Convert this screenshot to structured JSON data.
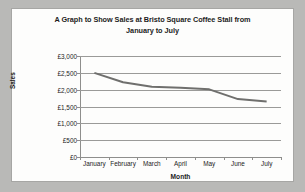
{
  "chart_data": {
    "type": "line",
    "title": "A Graph to Show Sales at Bristo Square Coffee Stall from January to July",
    "title_line1": "A Graph to Show Sales at Bristo Square Coffee Stall from",
    "title_line2": "January to July",
    "xlabel": "Month",
    "ylabel": "Sales",
    "categories": [
      "January",
      "February",
      "March",
      "April",
      "May",
      "June",
      "July"
    ],
    "values": [
      2500,
      2220,
      2090,
      2060,
      2010,
      1720,
      1650
    ],
    "ytick_labels": [
      "£3,000",
      "£2,500",
      "£2,000",
      "£1,500",
      "£1,000",
      "£500",
      "£0"
    ],
    "ytick_values": [
      3000,
      2500,
      2000,
      1500,
      1000,
      500,
      0
    ],
    "ylim": [
      0,
      3000
    ],
    "grid": true,
    "legend": "none",
    "series_color": "#6f6f6d",
    "grid_color": "#9a9a98",
    "axis_color": "#8e8e8c",
    "plot_background": "#fdfdfc",
    "page_background": "#b9b9b7",
    "currency_symbol": "£"
  }
}
